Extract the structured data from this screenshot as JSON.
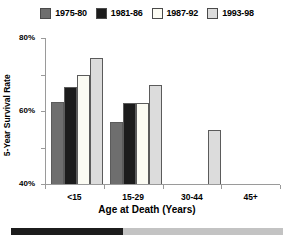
{
  "chart_data": {
    "type": "bar",
    "title": "",
    "xlabel": "Age at Death (Years)",
    "ylabel": "5-Year Survival Rate",
    "categories": [
      "<15",
      "15-29",
      "30-44",
      "45+"
    ],
    "series": [
      {
        "name": "1975-80",
        "color": "#6e6e6e",
        "values": [
          45,
          34,
          null,
          null
        ]
      },
      {
        "name": "1981-86",
        "color": "#1c1c1c",
        "values": [
          53,
          44.5,
          null,
          null
        ]
      },
      {
        "name": "1987-92",
        "color": "#fbfbf3",
        "values": [
          59.5,
          44.5,
          null,
          null
        ]
      },
      {
        "name": "1993-98",
        "color": "#dcdcdc",
        "values": [
          69,
          54,
          29.5,
          null
        ]
      }
    ],
    "ylim": [
      0,
      80
    ],
    "yticks": [
      0,
      20,
      40,
      60,
      80
    ],
    "ytick_labels": [
      "0",
      "20%",
      "40%",
      "60%",
      "80%"
    ],
    "grid": false,
    "legend_position": "top"
  },
  "legend": {
    "entries": [
      {
        "label": "1975-80"
      },
      {
        "label": "1981-86"
      },
      {
        "label": "1987-92"
      },
      {
        "label": "1993-98"
      }
    ]
  },
  "axes": {
    "y_title": "5-Year Survival Rate",
    "x_title": "Age at Death (Years)",
    "y_tick_labels": [
      "80%",
      "60%",
      "40%",
      "20%",
      "0"
    ],
    "x_tick_labels": [
      "<15",
      "15-29",
      "30-44",
      "45+"
    ]
  },
  "footer": {
    "progress_label": "",
    "fill_percent": 41,
    "fill_color": "#1c1c1c",
    "track_color": "#c3c3c3"
  }
}
